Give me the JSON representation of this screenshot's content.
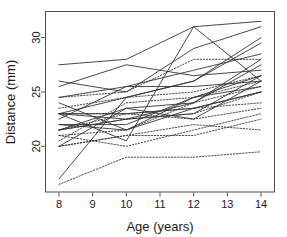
{
  "chart_data": {
    "type": "line",
    "title": "",
    "subtitle": "",
    "xlabel": "Age (years)",
    "ylabel": "Distance (mm)",
    "xlim": [
      7.6,
      14.4
    ],
    "ylim": [
      15.8,
      32.4
    ],
    "xticks": [
      8,
      9,
      10,
      11,
      12,
      13,
      14
    ],
    "xtick_labels": [
      "8",
      "9",
      "10",
      "11",
      "12",
      "13",
      "14"
    ],
    "yticks": [
      20,
      25,
      30
    ],
    "ytick_labels": [
      "20",
      "25",
      "30"
    ],
    "grid": false,
    "legend": null,
    "annotations": [],
    "x": [
      8,
      10,
      12,
      14
    ],
    "line_styles": {
      "solid": "Male subjects",
      "dotted": "Female subjects"
    },
    "colors": {
      "line": "#333333",
      "axis": "#4d4d4d",
      "text": "#1a1a1a",
      "background": "#ffffff"
    },
    "series": [
      {
        "name": "M01",
        "style": "solid",
        "values": [
          26.0,
          25.0,
          29.0,
          31.0
        ]
      },
      {
        "name": "M02",
        "style": "solid",
        "values": [
          21.5,
          22.5,
          23.0,
          26.5
        ]
      },
      {
        "name": "M03",
        "style": "solid",
        "values": [
          23.0,
          22.5,
          24.0,
          27.5
        ]
      },
      {
        "name": "M04",
        "style": "solid",
        "values": [
          25.5,
          27.5,
          26.5,
          27.0
        ]
      },
      {
        "name": "M05",
        "style": "solid",
        "values": [
          20.0,
          23.5,
          22.5,
          26.0
        ]
      },
      {
        "name": "M06",
        "style": "solid",
        "values": [
          24.5,
          25.5,
          27.0,
          28.5
        ]
      },
      {
        "name": "M07",
        "style": "solid",
        "values": [
          22.0,
          22.0,
          24.5,
          26.5
        ]
      },
      {
        "name": "M08",
        "style": "solid",
        "values": [
          24.0,
          21.5,
          24.5,
          25.5
        ]
      },
      {
        "name": "M09",
        "style": "solid",
        "values": [
          23.0,
          20.5,
          31.0,
          26.0
        ]
      },
      {
        "name": "M10",
        "style": "solid",
        "values": [
          27.5,
          28.0,
          31.0,
          31.5
        ]
      },
      {
        "name": "M11",
        "style": "solid",
        "values": [
          23.0,
          23.0,
          23.5,
          25.0
        ]
      },
      {
        "name": "M12",
        "style": "solid",
        "values": [
          21.5,
          23.5,
          24.0,
          28.0
        ]
      },
      {
        "name": "M13",
        "style": "solid",
        "values": [
          17.0,
          24.5,
          26.0,
          29.5
        ]
      },
      {
        "name": "M14",
        "style": "solid",
        "values": [
          22.5,
          25.5,
          25.5,
          26.0
        ]
      },
      {
        "name": "M15",
        "style": "solid",
        "values": [
          23.0,
          24.5,
          26.0,
          30.0
        ]
      },
      {
        "name": "M16",
        "style": "solid",
        "values": [
          22.0,
          21.5,
          23.5,
          25.0
        ]
      },
      {
        "name": "F01",
        "style": "dotted",
        "values": [
          21.0,
          20.0,
          21.5,
          23.0
        ]
      },
      {
        "name": "F02",
        "style": "dotted",
        "values": [
          21.0,
          21.5,
          24.0,
          25.5
        ]
      },
      {
        "name": "F03",
        "style": "dotted",
        "values": [
          20.5,
          24.0,
          24.5,
          26.0
        ]
      },
      {
        "name": "F04",
        "style": "dotted",
        "values": [
          23.5,
          24.5,
          25.0,
          26.5
        ]
      },
      {
        "name": "F05",
        "style": "dotted",
        "values": [
          21.5,
          23.0,
          22.5,
          23.5
        ]
      },
      {
        "name": "F06",
        "style": "dotted",
        "values": [
          20.0,
          21.0,
          21.0,
          22.5
        ]
      },
      {
        "name": "F07",
        "style": "dotted",
        "values": [
          21.5,
          22.5,
          23.0,
          25.0
        ]
      },
      {
        "name": "F08",
        "style": "dotted",
        "values": [
          23.0,
          23.0,
          23.5,
          24.0
        ]
      },
      {
        "name": "F09",
        "style": "dotted",
        "values": [
          20.0,
          21.0,
          22.0,
          21.5
        ]
      },
      {
        "name": "F10",
        "style": "dotted",
        "values": [
          16.5,
          19.0,
          19.0,
          19.5
        ]
      },
      {
        "name": "F11",
        "style": "dotted",
        "values": [
          24.5,
          25.0,
          28.0,
          28.0
        ]
      }
    ]
  }
}
